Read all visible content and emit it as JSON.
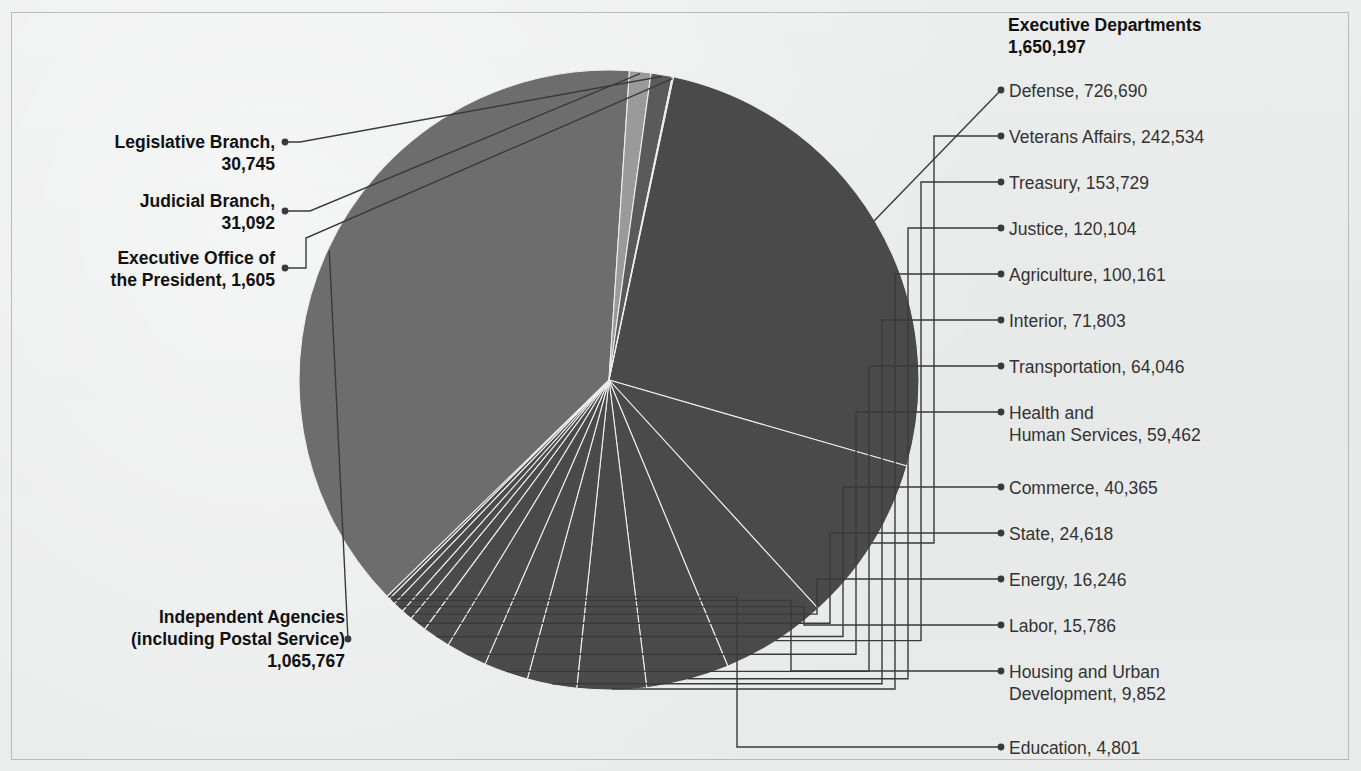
{
  "chart_data": {
    "type": "pie",
    "total": 2779406,
    "center": {
      "x": 609,
      "y": 380
    },
    "radius": 310,
    "start_angle_deg": 12,
    "legend": "leader-lines",
    "groups": [
      {
        "name": "Executive Departments",
        "value": 1650197,
        "value_label": "1,650,197",
        "color": "#4a4a4a",
        "side": "right",
        "items": [
          {
            "label": "Defense, 726,690",
            "name": "Defense",
            "value": 726690
          },
          {
            "label": "Veterans Affairs, 242,534",
            "name": "Veterans Affairs",
            "value": 242534
          },
          {
            "label": "Treasury, 153,729",
            "name": "Treasury",
            "value": 153729
          },
          {
            "label": "Justice, 120,104",
            "name": "Justice",
            "value": 120104
          },
          {
            "label": "Agriculture, 100,161",
            "name": "Agriculture",
            "value": 100161
          },
          {
            "label": "Interior, 71,803",
            "name": "Interior",
            "value": 71803
          },
          {
            "label": "Transportation, 64,046",
            "name": "Transportation",
            "value": 64046
          },
          {
            "label": "Health and\nHuman Services, 59,462",
            "name": "Health and Human Services",
            "value": 59462
          },
          {
            "label": "Commerce, 40,365",
            "name": "Commerce",
            "value": 40365
          },
          {
            "label": "State, 24,618",
            "name": "State",
            "value": 24618
          },
          {
            "label": "Energy, 16,246",
            "name": "Energy",
            "value": 16246
          },
          {
            "label": "Labor, 15,786",
            "name": "Labor",
            "value": 15786
          },
          {
            "label": "Housing and Urban\nDevelopment, 9,852",
            "name": "Housing and Urban Development",
            "value": 9852
          },
          {
            "label": "Education, 4,801",
            "name": "Education",
            "value": 4801
          }
        ]
      },
      {
        "name": "Independent Agencies (including Postal Service)",
        "value": 1065767,
        "value_label": "1,065,767",
        "color": "#6d6d6d",
        "side": "left",
        "items": []
      },
      {
        "name": "Judicial Branch",
        "value": 31092,
        "value_label": "31,092",
        "color": "#9a9a9a",
        "side": "left",
        "items": []
      },
      {
        "name": "Legislative Branch",
        "value": 30745,
        "value_label": "30,745",
        "color": "#5a5a5a",
        "side": "left",
        "items": []
      },
      {
        "name": "Executive Office of the President",
        "value": 1605,
        "value_label": "1,605",
        "color": "#8a8a8a",
        "side": "left",
        "items": []
      }
    ]
  },
  "labels": {
    "exec_header_line1": "Executive Departments",
    "exec_header_line2": "1,650,197",
    "legislative_line1": "Legislative Branch,",
    "legislative_line2": "30,745",
    "judicial_line1": "Judicial Branch,",
    "judicial_line2": "31,092",
    "eop_line1": "Executive Office of",
    "eop_line2": "the President, 1,605",
    "independent_line1": "Independent Agencies",
    "independent_line2": "(including Postal Service)",
    "independent_line3": "1,065,767",
    "right_items": [
      "Defense, 726,690",
      "Veterans Affairs, 242,534",
      "Treasury, 153,729",
      "Justice, 120,104",
      "Agriculture, 100,161",
      "Interior, 71,803",
      "Transportation, 64,046",
      "Health and",
      "Human Services, 59,462",
      "Commerce, 40,365",
      "State, 24,618",
      "Energy, 16,246",
      "Labor, 15,786",
      "Housing and Urban",
      "Development, 9,852",
      "Education, 4,801"
    ]
  },
  "colors": {
    "background": "#e9eaea",
    "slice_dark": "#4a4a4a",
    "slice_mid": "#6d6d6d",
    "slice_light": "#9a9a9a",
    "leader_line": "#3a3a3a",
    "text": "#2b2b2b"
  }
}
